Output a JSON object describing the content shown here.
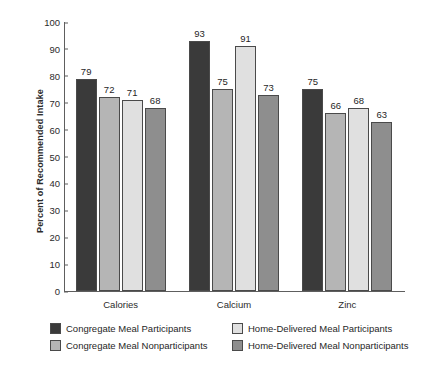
{
  "chart_data": {
    "type": "bar",
    "title": "",
    "subtitle": "",
    "xlabel": "",
    "ylabel": "Percent of Recommended Intake",
    "ylim": [
      0,
      100
    ],
    "ytick_step": 10,
    "yticks": [
      0,
      10,
      20,
      30,
      40,
      50,
      60,
      70,
      80,
      90,
      100
    ],
    "grid": false,
    "legend_position": "bottom",
    "categories": [
      "Calories",
      "Calcium",
      "Zinc"
    ],
    "series": [
      {
        "name": "Congregate Meal Participants",
        "color": "#3a3a3a",
        "values": [
          79,
          93,
          75
        ]
      },
      {
        "name": "Congregate Meal Nonparticipants",
        "color": "#b5b5b5",
        "values": [
          72,
          75,
          66
        ]
      },
      {
        "name": "Home-Delivered Meal Participants",
        "color": "#e0e0e0",
        "values": [
          71,
          91,
          68
        ]
      },
      {
        "name": "Home-Delivered Meal Nonparticipants",
        "color": "#8e8e8e",
        "values": [
          68,
          73,
          63
        ]
      }
    ],
    "legend": [
      {
        "label": "Congregate Meal Participants",
        "color": "#3a3a3a"
      },
      {
        "label": "Home-Delivered Meal Participants",
        "color": "#e0e0e0"
      },
      {
        "label": "Congregate Meal Nonparticipants",
        "color": "#b5b5b5"
      },
      {
        "label": "Home-Delivered Meal Nonparticipants",
        "color": "#8e8e8e"
      }
    ]
  }
}
